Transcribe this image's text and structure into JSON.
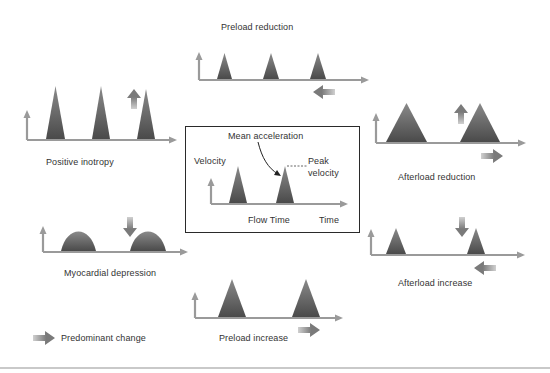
{
  "colors": {
    "axis": "#9a9a9a",
    "peak_top": "#8a8a8a",
    "peak_bottom": "#4a4a4a",
    "arrow": "#7a7a7a",
    "text": "#333333",
    "box_border": "#2a2a2a"
  },
  "labels": {
    "preload_reduction": "Preload reduction",
    "positive_inotropy": "Positive inotropy",
    "afterload_reduction": "Afterload reduction",
    "myocardial_depression": "Myocardial depression",
    "afterload_increase": "Afterload increase",
    "preload_increase": "Preload increase",
    "legend": "Predominant change"
  },
  "center": {
    "mean_acceleration": "Mean acceleration",
    "velocity": "Velocity",
    "peak_velocity_line1": "Peak",
    "peak_velocity_line2": "velocity",
    "flow_time": "Flow Time",
    "time": "Time"
  },
  "panels": [
    {
      "id": "preload-reduction",
      "origin": [
        199,
        80
      ],
      "width": 170,
      "yaxis_height": 28,
      "peaks": [
        {
          "x0": 217,
          "x1": 232,
          "h": 27,
          "shape": "tri"
        },
        {
          "x0": 263,
          "x1": 279,
          "h": 27,
          "shape": "tri"
        },
        {
          "x0": 310,
          "x1": 326,
          "h": 27,
          "shape": "tri"
        }
      ],
      "arrows": [
        {
          "type": "left",
          "x": 313,
          "y": 92
        }
      ]
    },
    {
      "id": "positive-inotropy",
      "origin": [
        27,
        140
      ],
      "width": 150,
      "yaxis_height": 30,
      "peaks": [
        {
          "x0": 46,
          "x1": 65,
          "h": 54,
          "shape": "tri"
        },
        {
          "x0": 92,
          "x1": 110,
          "h": 54,
          "shape": "tri"
        },
        {
          "x0": 137,
          "x1": 155,
          "h": 51,
          "shape": "tri"
        }
      ],
      "arrows": [
        {
          "type": "up",
          "x": 134,
          "y": 89
        }
      ]
    },
    {
      "id": "afterload-reduction",
      "origin": [
        376,
        143
      ],
      "width": 150,
      "yaxis_height": 30,
      "peaks": [
        {
          "x0": 386,
          "x1": 427,
          "h": 40,
          "shape": "tri"
        },
        {
          "x0": 460,
          "x1": 500,
          "h": 40,
          "shape": "tri"
        }
      ],
      "arrows": [
        {
          "type": "up",
          "x": 461,
          "y": 104
        },
        {
          "type": "right",
          "x": 481,
          "y": 156
        }
      ]
    },
    {
      "id": "myocardial-depression",
      "origin": [
        43,
        252
      ],
      "width": 145,
      "yaxis_height": 26,
      "peaks": [
        {
          "x0": 61,
          "x1": 96,
          "h": 20,
          "shape": "bell"
        },
        {
          "x0": 130,
          "x1": 166,
          "h": 20,
          "shape": "bell"
        }
      ],
      "arrows": [
        {
          "type": "down",
          "x": 130,
          "y": 217
        }
      ]
    },
    {
      "id": "afterload-increase",
      "origin": [
        371,
        255
      ],
      "width": 154,
      "yaxis_height": 26,
      "peaks": [
        {
          "x0": 386,
          "x1": 406,
          "h": 27,
          "shape": "tri"
        },
        {
          "x0": 467,
          "x1": 485,
          "h": 27,
          "shape": "tri"
        }
      ],
      "arrows": [
        {
          "type": "down",
          "x": 462,
          "y": 217
        },
        {
          "type": "left",
          "x": 474,
          "y": 268
        }
      ]
    },
    {
      "id": "preload-increase",
      "origin": [
        195,
        318
      ],
      "width": 148,
      "yaxis_height": 26,
      "peaks": [
        {
          "x0": 218,
          "x1": 246,
          "h": 39,
          "shape": "tri"
        },
        {
          "x0": 292,
          "x1": 320,
          "h": 39,
          "shape": "tri"
        }
      ],
      "arrows": [
        {
          "type": "right",
          "x": 298,
          "y": 330
        }
      ]
    },
    {
      "id": "center-velocity",
      "origin": [
        211,
        204
      ],
      "width": 137,
      "yaxis_height": 26,
      "peaks": [
        {
          "x0": 229,
          "x1": 247,
          "h": 38,
          "shape": "tri"
        },
        {
          "x0": 276,
          "x1": 294,
          "h": 38,
          "shape": "tri"
        }
      ],
      "arrows": []
    }
  ],
  "legend_arrow": {
    "type": "right",
    "x": 33,
    "y": 338
  }
}
